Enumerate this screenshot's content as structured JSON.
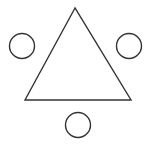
{
  "diagram": {
    "background": "#ffffff",
    "stroke_color": "#333333",
    "stroke_width": 1.4,
    "shapes": {
      "triangle": {
        "points": "75,8 25,100 131,100"
      },
      "circles": [
        {
          "name": "left-circle",
          "cx": 22,
          "cy": 46,
          "r": 12.5
        },
        {
          "name": "right-circle",
          "cx": 129,
          "cy": 46,
          "r": 12.5
        },
        {
          "name": "bottom-circle",
          "cx": 78,
          "cy": 125,
          "r": 12.5
        }
      ]
    }
  }
}
